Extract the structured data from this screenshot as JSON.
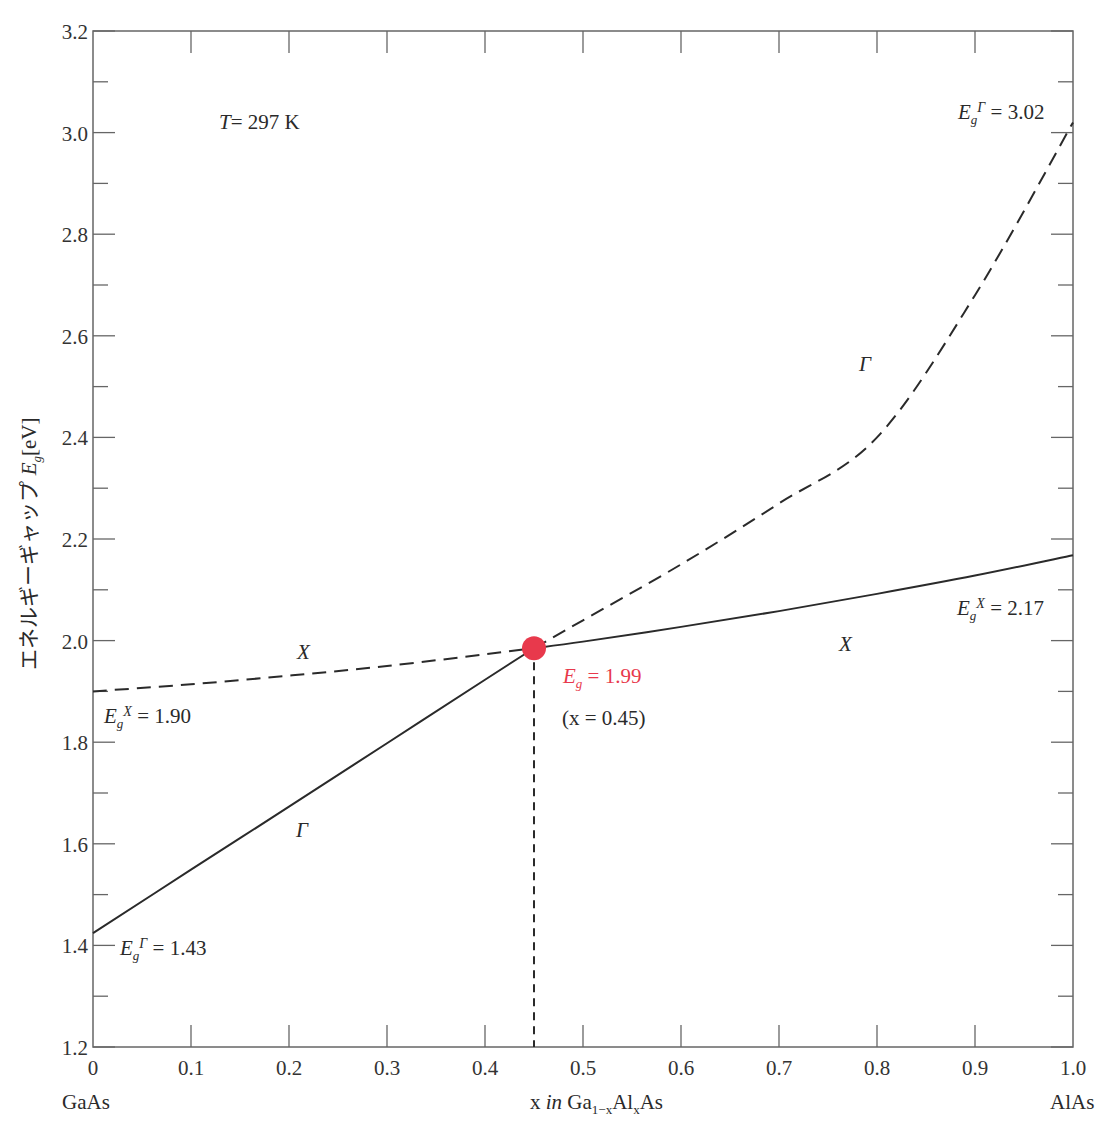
{
  "chart_data": {
    "type": "line",
    "title": "",
    "xlabel": "x in Ga1-xAlxAs",
    "ylabel": "エネルギーギャップ Eg[eV]",
    "xlim": [
      0,
      1.0
    ],
    "ylim": [
      1.2,
      3.2
    ],
    "grid": false,
    "x_ticks": [
      "0",
      "0.1",
      "0.2",
      "0.3",
      "0.4",
      "0.5",
      "0.6",
      "0.7",
      "0.8",
      "0.9",
      "1.0"
    ],
    "y_ticks": [
      "1.2",
      "1.4",
      "1.6",
      "1.8",
      "2.0",
      "2.2",
      "2.4",
      "2.6",
      "2.8",
      "3.0",
      "3.2"
    ],
    "x_end_labels": {
      "left": "GaAs",
      "right": "AlAs"
    },
    "series": [
      {
        "name": "Γ (direct, solid)",
        "style": "solid",
        "x": [
          0,
          0.1,
          0.2,
          0.3,
          0.4,
          0.45
        ],
        "values": [
          1.424,
          1.549,
          1.673,
          1.798,
          1.923,
          1.985
        ]
      },
      {
        "name": "Γ (direct, dashed)",
        "style": "dashed",
        "x": [
          0.45,
          0.5,
          0.6,
          0.7,
          0.8,
          0.9,
          1.0
        ],
        "values": [
          1.985,
          2.04,
          2.15,
          2.27,
          2.4,
          2.68,
          3.02
        ]
      },
      {
        "name": "X (indirect, dashed)",
        "style": "dashed",
        "x": [
          0,
          0.1,
          0.2,
          0.3,
          0.4,
          0.45
        ],
        "values": [
          1.9,
          1.914,
          1.931,
          1.95,
          1.973,
          1.985
        ]
      },
      {
        "name": "X (indirect, solid)",
        "style": "solid",
        "x": [
          0.45,
          0.5,
          0.6,
          0.7,
          0.8,
          0.9,
          1.0
        ],
        "values": [
          1.985,
          1.998,
          2.027,
          2.058,
          2.092,
          2.128,
          2.168
        ]
      }
    ],
    "crossover_point": {
      "x": 0.45,
      "y": 1.99,
      "color": "#e8394c"
    },
    "annotations": [
      {
        "text": "T = 297 K",
        "x": 0.2,
        "y": 3.0
      },
      {
        "text": "EgΓ = 3.02",
        "x": 0.95,
        "y": 3.04
      },
      {
        "text": "EgX = 2.17",
        "x": 0.95,
        "y": 2.06
      },
      {
        "text": "EgX = 1.90",
        "x": 0.06,
        "y": 1.84
      },
      {
        "text": "EgΓ = 1.43",
        "x": 0.07,
        "y": 1.38
      },
      {
        "text": "Eg = 1.99",
        "x": 0.52,
        "y": 1.92,
        "color": "#e8394c"
      },
      {
        "text": "(x = 0.45)",
        "x": 0.52,
        "y": 1.85
      },
      {
        "text": "X",
        "x": 0.21,
        "y": 1.97
      },
      {
        "text": "X",
        "x": 0.77,
        "y": 1.99
      },
      {
        "text": "Γ",
        "x": 0.79,
        "y": 2.55
      },
      {
        "text": "Γ",
        "x": 0.21,
        "y": 1.62
      }
    ]
  },
  "labels": {
    "temperature": "T",
    "temperature_value": "= 297 K",
    "ylabel_jp": "エネルギーギャップ ",
    "ylabel_sym": "E",
    "ylabel_sub": "g",
    "ylabel_unit": "[eV]",
    "xlabel_x": "x ",
    "xlabel_in": "in",
    "xlabel_ga": " Ga",
    "xlabel_sub1": "1−x",
    "xlabel_al": "Al",
    "xlabel_sub2": "x",
    "xlabel_as": "As",
    "left_material": "GaAs",
    "right_material": "AlAs",
    "eg_gamma_top_val": "= 3.02",
    "eg_x_right_val": "= 2.17",
    "eg_x_left_val": "= 1.90",
    "eg_gamma_bottom_val": "= 1.43",
    "eg_cross_val": "= 1.99",
    "cross_x": "(x = 0.45)",
    "sym_E": "E",
    "sym_g": "g",
    "sym_gamma": "Γ",
    "sym_X": "X"
  },
  "colors": {
    "accent": "#e8394c",
    "axis": "#555555",
    "line": "#2a2a2a"
  }
}
